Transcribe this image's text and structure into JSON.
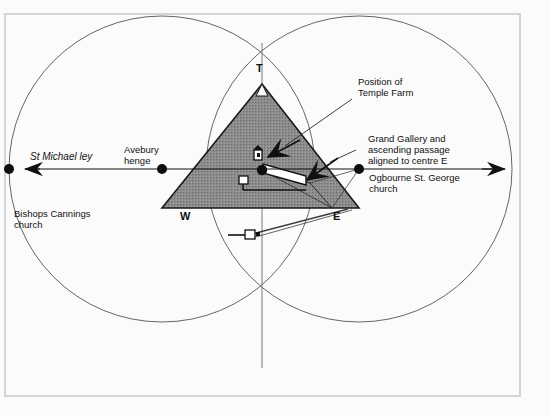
{
  "diagram": {
    "title_present": false,
    "colors": {
      "frame": "#d4d4d4",
      "background": "#fbfbfb",
      "pyramid_fill": "#8a8a8a",
      "line": "#1a1a1a",
      "circle_line": "#4a4a4a"
    },
    "labels": {
      "apex": "T",
      "west": "W",
      "east": "E",
      "st_michael_ley": "St Michael ley",
      "avebury_henge": "Avebury\nhenge",
      "bishops_cannings": "Bishops Cannings\nchurch",
      "position_temple_farm": "Position of\nTemple Farm",
      "grand_gallery": "Grand Gallery and\nascending passage\naligned to centre E",
      "ogbourne": "Ogbourne St. George\nchurch"
    },
    "nodes": [
      {
        "name": "bishops-cannings-church",
        "x": 9,
        "y": 169
      },
      {
        "name": "avebury-henge",
        "x": 162,
        "y": 169
      },
      {
        "name": "ogbourne-st-george-church",
        "x": 359,
        "y": 169
      },
      {
        "name": "temple-farm",
        "x": 262,
        "y": 170
      }
    ],
    "circles": [
      {
        "name": "west-circle",
        "cx": 162,
        "cy": 169,
        "r": 153
      },
      {
        "name": "east-circle",
        "cx": 359,
        "cy": 169,
        "r": 153
      }
    ],
    "pyramid": {
      "apex": {
        "x": 262,
        "y": 84
      },
      "base_left": {
        "x": 162,
        "y": 208
      },
      "base_right": {
        "x": 359,
        "y": 208
      }
    },
    "ley_line": {
      "y": 169,
      "x_start": 9,
      "x_end": 512
    }
  }
}
